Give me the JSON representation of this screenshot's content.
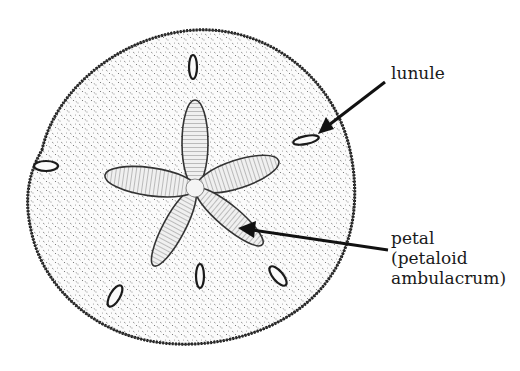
{
  "diagram": {
    "labels": [
      {
        "id": "lunule",
        "lines": [
          "lunule"
        ]
      },
      {
        "id": "petal",
        "lines": [
          "petal",
          "(petaloid",
          "ambulacrum)"
        ]
      }
    ],
    "colors": {
      "ink": "#1a1a1a",
      "background": "#ffffff",
      "stipple": "#555555"
    }
  }
}
